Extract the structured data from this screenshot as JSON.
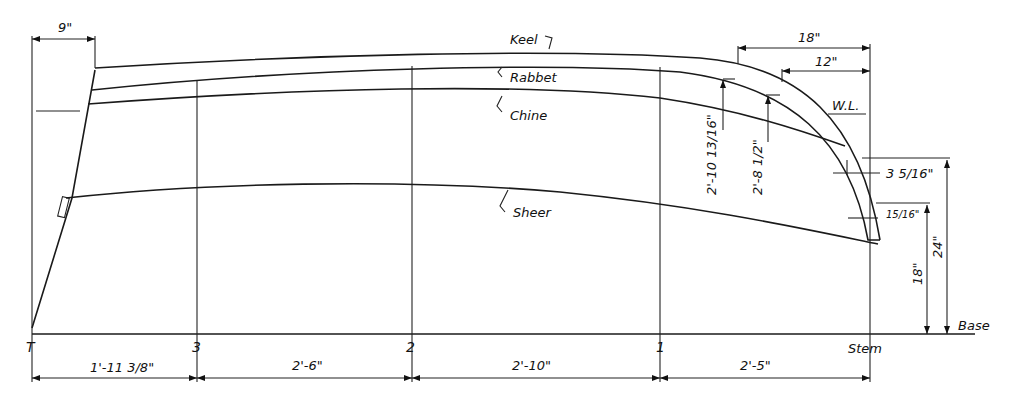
{
  "drawing": {
    "title": "Boat lines — profile view with stations",
    "curve_labels": {
      "keel": "Keel",
      "rabbet": "Rabbet",
      "chine": "Chine",
      "sheer": "Sheer",
      "waterline": "W.L.",
      "base": "Base"
    },
    "stations": [
      {
        "label": "T",
        "x": 32
      },
      {
        "label": "3",
        "x": 197
      },
      {
        "label": "2",
        "x": 412
      },
      {
        "label": "1",
        "x": 660
      },
      {
        "label": "Stem",
        "x": 870
      }
    ],
    "station_spacings": [
      "1'-11 3/8\"",
      "2'-6\"",
      "2'-10\"",
      "2'-5\""
    ],
    "dimensions": {
      "transom_rake": "9\"",
      "stem_18": "18\"",
      "stem_12": "12\"",
      "rabbet_height_a": "2'-10 13/16\"",
      "rabbet_height_b": "2'-8 1/2\"",
      "stem_thickness_upper": "3 5/16\"",
      "stem_thickness_lower": "15/16\"",
      "height_18": "18\"",
      "height_24": "24\""
    }
  }
}
